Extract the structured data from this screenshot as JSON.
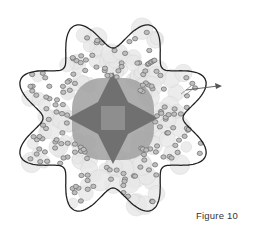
{
  "figure": {
    "caption": "Figure 10",
    "colors": {
      "outline": "#222222",
      "core_dark": "#6e6e6e",
      "core_mid": "#8a8a8a",
      "core_light": "#a9a9a9",
      "sphere_fill": "#e6e6e6",
      "bead_fill": "#bdbdbd",
      "bead_stroke": "#6a6a6a",
      "arrow": "#555555"
    },
    "shape": {
      "lobes": 8,
      "center": [
        113,
        118
      ],
      "outer_radius": 100,
      "inner_radius": 70
    },
    "arrow": {
      "from": [
        188,
        88
      ],
      "to": [
        222,
        86
      ]
    }
  }
}
